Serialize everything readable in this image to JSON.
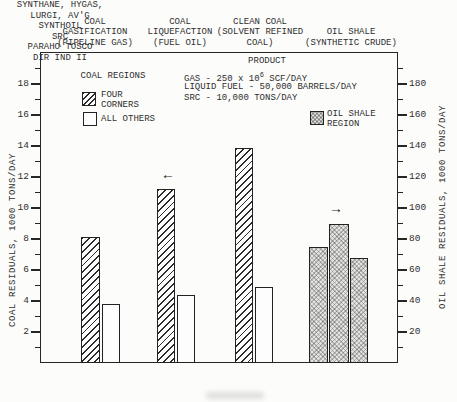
{
  "figure": {
    "headers": [
      {
        "lines": [
          "COAL",
          "GASIFICATION",
          "(PIPELINE GAS)"
        ]
      },
      {
        "lines": [
          "COAL",
          "LIQUEFACTION",
          "(FUEL OIL)"
        ]
      },
      {
        "lines": [
          "CLEAN COAL",
          "(SOLVENT REFINED",
          "COAL)"
        ]
      },
      {
        "lines": [
          "OIL SHALE",
          "(SYNTHETIC CRUDE)"
        ]
      }
    ],
    "legend_coal": {
      "title": "COAL REGIONS",
      "four_corners_line1": "FOUR",
      "four_corners_line2": "CORNERS",
      "all_others_label": "ALL OTHERS"
    },
    "legend_oil_shale": {
      "line1": "OIL SHALE",
      "line2": "REGION"
    },
    "product_note": {
      "title": "PRODUCT",
      "gas_prefix": "GAS - 250 x 10",
      "gas_exponent": "6",
      "gas_suffix": " SCF/DAY",
      "line2": "LIQUID FUEL - 50,000 BARRELS/DAY",
      "line3": "SRC - 10,000 TONS/DAY"
    },
    "icons": {
      "left_arrow": "←",
      "right_arrow": "→"
    },
    "colors": {
      "ink": "#262626",
      "paper": "#fcfcfb",
      "shaded_fill": "#e3e3e1"
    }
  },
  "chart_data": {
    "type": "bar",
    "title": "",
    "grid": false,
    "legend_position": "top-inside",
    "left_axis": {
      "label": "COAL RESIDUALS, 1000 TONS/DAY",
      "ticks": [
        2,
        4,
        6,
        8,
        10,
        12,
        14,
        16,
        18
      ],
      "minor_ticks": [
        1,
        3,
        5,
        7,
        9,
        11,
        13,
        15,
        17,
        19
      ],
      "range": [
        0,
        19.5
      ]
    },
    "right_axis": {
      "label": "OIL SHALE RESIDUALS, 1000 TONS/DAY",
      "ticks": [
        20,
        40,
        60,
        80,
        100,
        120,
        140,
        160,
        180
      ],
      "minor_ticks": [
        10,
        30,
        50,
        70,
        90,
        110,
        130,
        150,
        170,
        190
      ],
      "range": [
        0,
        195
      ]
    },
    "groups": [
      {
        "category_lines": [
          "SYNTHANE, HYGAS,",
          "LURGI, AV'G"
        ],
        "arrow": null,
        "bars": [
          {
            "series": "FOUR CORNERS",
            "style": "hatched",
            "axis": "left",
            "value": 8.1
          },
          {
            "series": "ALL OTHERS",
            "style": "open",
            "axis": "left",
            "value": 3.8
          }
        ]
      },
      {
        "category_lines": [
          "SYNTHOIL"
        ],
        "arrow": "left",
        "bars": [
          {
            "series": "FOUR CORNERS",
            "style": "hatched",
            "axis": "left",
            "value": 11.2
          },
          {
            "series": "ALL OTHERS",
            "style": "open",
            "axis": "left",
            "value": 4.4
          }
        ]
      },
      {
        "category_lines": [
          "SRC"
        ],
        "arrow": null,
        "bars": [
          {
            "series": "FOUR CORNERS",
            "style": "hatched",
            "axis": "left",
            "value": 13.9
          },
          {
            "series": "ALL OTHERS",
            "style": "open",
            "axis": "left",
            "value": 4.9
          }
        ]
      },
      {
        "category_lines": [
          "PARAHO TOSCO",
          "DIR IND II"
        ],
        "arrow": "right",
        "bars": [
          {
            "series": "OIL SHALE REGION",
            "style": "shaded",
            "axis": "right",
            "value": 75
          },
          {
            "series": "OIL SHALE REGION",
            "style": "shaded",
            "axis": "right",
            "value": 90
          },
          {
            "series": "OIL SHALE REGION",
            "style": "shaded",
            "axis": "right",
            "value": 68
          }
        ]
      }
    ]
  }
}
